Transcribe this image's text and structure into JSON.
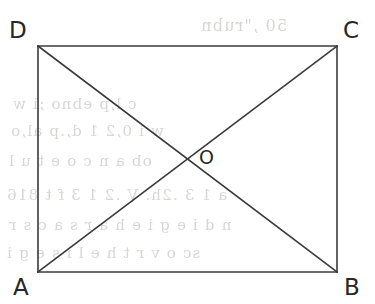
{
  "figure": {
    "type": "geometry-diagram",
    "canvas": {
      "width": 375,
      "height": 304,
      "background": "#ffffff"
    },
    "stroke": {
      "color": "#3a3a3a",
      "width": 1.6
    },
    "text_color": "#272727",
    "rectangle": {
      "name": "rectangle-ABCD",
      "left": 38,
      "top": 46,
      "right": 337,
      "bottom": 272,
      "width": 299,
      "height": 226
    },
    "vertices": [
      {
        "id": "A",
        "label": "A",
        "x": 38,
        "y": 272,
        "label_x": 13,
        "label_y": 276,
        "position": "bottom-left"
      },
      {
        "id": "B",
        "label": "B",
        "x": 337,
        "y": 272,
        "label_x": 344,
        "label_y": 276,
        "position": "bottom-right"
      },
      {
        "id": "C",
        "label": "C",
        "x": 337,
        "y": 46,
        "label_x": 343,
        "label_y": 19,
        "position": "top-right"
      },
      {
        "id": "D",
        "label": "D",
        "x": 38,
        "y": 46,
        "label_x": 9,
        "label_y": 19,
        "position": "top-left"
      }
    ],
    "interior_points": [
      {
        "id": "O",
        "label": "O",
        "x": 188,
        "y": 159,
        "label_x": 199,
        "label_y": 148,
        "description": "intersection of diagonals"
      }
    ],
    "edges": [
      {
        "id": "DC",
        "from": "D",
        "to": "C",
        "kind": "side"
      },
      {
        "id": "CB",
        "from": "C",
        "to": "B",
        "kind": "side"
      },
      {
        "id": "BA",
        "from": "B",
        "to": "A",
        "kind": "side"
      },
      {
        "id": "AD",
        "from": "A",
        "to": "D",
        "kind": "side"
      },
      {
        "id": "AC",
        "from": "A",
        "to": "C",
        "kind": "diagonal"
      },
      {
        "id": "DB",
        "from": "D",
        "to": "B",
        "kind": "diagonal"
      }
    ]
  },
  "bleed_through": {
    "note": "faint mirrored show-through text from the reverse side of the scanned page",
    "color": "#b9b6b2",
    "lines": [
      {
        "text": "50 ,\"rubn",
        "x": 200,
        "y": 16,
        "size": 16
      },
      {
        "text": "c l,p ebno ;i  w",
        "x": 12,
        "y": 95,
        "size": 15
      },
      {
        "text": "w  i 0,2 1 d,.p  al,o",
        "x": 10,
        "y": 122,
        "size": 15
      },
      {
        "text": "ob a n c o   e t   u   l",
        "x": 8,
        "y": 152,
        "size": 15
      },
      {
        "text": "a 1 3  .2h.  V  .2  1 3  f  t  816",
        "x": 6,
        "y": 186,
        "size": 15
      },
      {
        "text": "n   d i e g i e   h a r   s a c s r",
        "x": 8,
        "y": 216,
        "size": 15
      },
      {
        "text": "sc   o  v r t h e  l i s e  g i",
        "x": 6,
        "y": 244,
        "size": 15
      }
    ]
  }
}
